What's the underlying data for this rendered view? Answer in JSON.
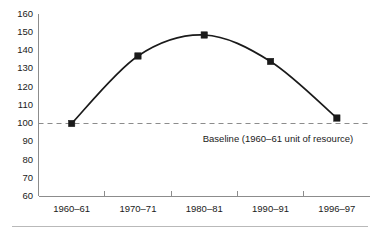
{
  "chart_data": {
    "type": "line",
    "title": "",
    "subtitle": "",
    "xlabel": "",
    "ylabel": "",
    "categories": [
      "1960–61",
      "1970–71",
      "1980–81",
      "1990–91",
      "1996–97"
    ],
    "values": [
      100,
      137,
      148.5,
      134,
      103
    ],
    "series": [
      {
        "name": "index",
        "values": [
          100,
          137,
          148.5,
          134,
          103
        ]
      }
    ],
    "ylim": [
      60,
      160
    ],
    "yticks": [
      60,
      70,
      80,
      90,
      100,
      110,
      120,
      130,
      140,
      150,
      160
    ],
    "ytick_labels": [
      "60",
      "70",
      "80",
      "90",
      "100",
      "110",
      "120",
      "130",
      "140",
      "150",
      "160"
    ],
    "grid": false,
    "legend": false,
    "legend_position": "none",
    "marker": "square",
    "line_style": "smooth",
    "annotations": [
      {
        "name": "baseline",
        "text": "Baseline (1960–61 unit of resource)",
        "value": 100,
        "style": "dashed-horizontal-line",
        "color": "#8c8c8c"
      }
    ],
    "colors": {
      "line": "#1a1a1a",
      "marker": "#1a1a1a",
      "axis": "#8c8c8c",
      "baseline": "#8c8c8c",
      "text": "#1a1a1a",
      "background": "#ffffff",
      "footer_rule": "#b9b9b9"
    }
  }
}
